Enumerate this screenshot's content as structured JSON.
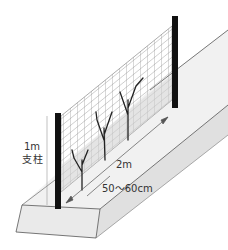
{
  "diagram": {
    "title": "",
    "labels": {
      "post_height": "1m",
      "post_name": "支柱",
      "net_length": "2m",
      "plant_spacing": "50～60cm"
    },
    "elements": [
      {
        "name": "raised-bed",
        "description": "long trapezoidal raised soil bed in perspective"
      },
      {
        "name": "left-post",
        "description": "black support post at front"
      },
      {
        "name": "right-post",
        "description": "black support post at back"
      },
      {
        "name": "net",
        "description": "grid netting strung between posts"
      },
      {
        "name": "plants",
        "description": "three young branching seedlings along the net"
      },
      {
        "name": "height-dimension-line",
        "description": "vertical dimension for 1m post height"
      },
      {
        "name": "length-arrow",
        "description": "arrow indicating 2m between posts"
      },
      {
        "name": "spacing-arrow",
        "description": "arrow indicating 50～60cm plant spacing"
      }
    ],
    "colors": {
      "post": "#111111",
      "net": "#8a8a8a",
      "bed_top": "#efefef",
      "bed_side": "#e2e2e2",
      "bed_outline": "#555555",
      "plant": "#222222",
      "label": "#333333"
    }
  }
}
